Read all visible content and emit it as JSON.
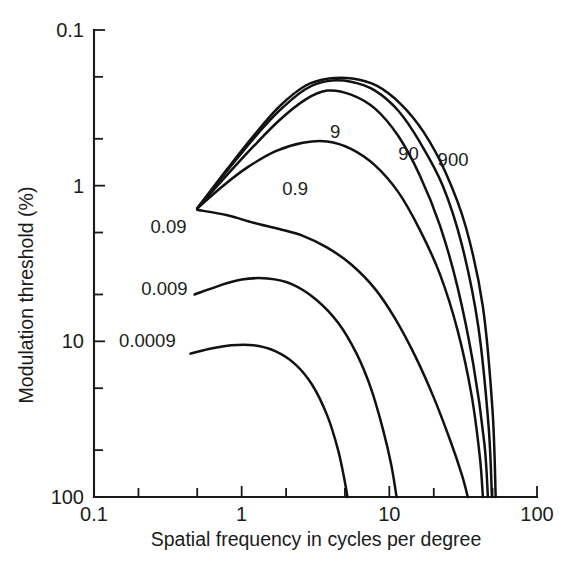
{
  "chart_data": {
    "type": "line",
    "title": "",
    "xlabel": "Spatial frequency in cycles per degree",
    "ylabel": "Modulation threshold (%)",
    "xscale": "log",
    "yscale": "log",
    "y_inverted": true,
    "xlim": [
      0.1,
      100
    ],
    "ylim": [
      0.1,
      100
    ],
    "grid": false,
    "legend": "inline curve labels",
    "x_tick_labels": [
      "0.1",
      "1",
      "10",
      "100"
    ],
    "x_major_ticks": [
      0.1,
      1,
      10,
      100
    ],
    "x_minor_ticks": [
      0.2,
      0.5,
      2,
      5,
      20,
      50
    ],
    "y_tick_labels": [
      "0.1",
      "1",
      "10",
      "100"
    ],
    "y_major_ticks": [
      0.1,
      1,
      10,
      100
    ],
    "y_minor_ticks": [
      0.2,
      0.5,
      2,
      5,
      20,
      50
    ],
    "series": [
      {
        "name": "0.0009",
        "label": "0.0009",
        "label_x": 0.23,
        "label_y": 10.0,
        "points": [
          [
            0.45,
            12.0
          ],
          [
            0.6,
            11.2
          ],
          [
            0.85,
            10.6
          ],
          [
            1.2,
            10.6
          ],
          [
            1.7,
            11.6
          ],
          [
            2.3,
            14.0
          ],
          [
            3.0,
            19.0
          ],
          [
            3.8,
            30.0
          ],
          [
            4.5,
            50.0
          ],
          [
            5.0,
            80.0
          ],
          [
            5.2,
            100.0
          ]
        ]
      },
      {
        "name": "0.009",
        "label": "0.009",
        "label_x": 0.3,
        "label_y": 4.6,
        "points": [
          [
            0.48,
            5.0
          ],
          [
            0.7,
            4.4
          ],
          [
            1.0,
            4.0
          ],
          [
            1.5,
            3.95
          ],
          [
            2.2,
            4.3
          ],
          [
            3.2,
            5.4
          ],
          [
            4.5,
            7.6
          ],
          [
            6.0,
            12.0
          ],
          [
            7.5,
            20.0
          ],
          [
            9.0,
            36.0
          ],
          [
            10.3,
            62.0
          ],
          [
            11.2,
            100.0
          ]
        ]
      },
      {
        "name": "0.09",
        "label": "0.09",
        "label_x": 0.32,
        "label_y": 1.85,
        "points": [
          [
            0.5,
            1.43
          ],
          [
            0.8,
            1.55
          ],
          [
            1.2,
            1.73
          ],
          [
            1.8,
            1.9
          ],
          [
            2.6,
            2.1
          ],
          [
            3.8,
            2.5
          ],
          [
            5.5,
            3.2
          ],
          [
            8.0,
            4.6
          ],
          [
            11.0,
            7.2
          ],
          [
            15.0,
            12.5
          ],
          [
            20.0,
            23.0
          ],
          [
            26.0,
            44.0
          ],
          [
            31.0,
            72.0
          ],
          [
            34.0,
            100.0
          ]
        ]
      },
      {
        "name": "0.9",
        "label": "0.9",
        "label_x": 2.3,
        "label_y": 1.05,
        "points": [
          [
            0.5,
            1.4
          ],
          [
            0.75,
            1.0
          ],
          [
            1.1,
            0.76
          ],
          [
            1.7,
            0.6
          ],
          [
            2.6,
            0.53
          ],
          [
            3.8,
            0.52
          ],
          [
            5.5,
            0.58
          ],
          [
            8.0,
            0.74
          ],
          [
            11.5,
            1.1
          ],
          [
            16.0,
            1.9
          ],
          [
            22.0,
            3.7
          ],
          [
            29.0,
            8.5
          ],
          [
            36.0,
            22.0
          ],
          [
            41.0,
            55.0
          ],
          [
            43.0,
            100.0
          ]
        ]
      },
      {
        "name": "9",
        "label": "9",
        "label_x": 4.3,
        "label_y": 0.45,
        "points": [
          [
            0.5,
            1.4
          ],
          [
            0.8,
            0.85
          ],
          [
            1.2,
            0.56
          ],
          [
            1.8,
            0.38
          ],
          [
            2.7,
            0.28
          ],
          [
            3.8,
            0.245
          ],
          [
            5.5,
            0.26
          ],
          [
            8.0,
            0.32
          ],
          [
            11.5,
            0.48
          ],
          [
            16.0,
            0.85
          ],
          [
            22.0,
            1.8
          ],
          [
            29.0,
            4.5
          ],
          [
            37.0,
            14.0
          ],
          [
            44.0,
            45.0
          ],
          [
            46.5,
            100.0
          ]
        ]
      },
      {
        "name": "90",
        "label": "90",
        "label_x": 13.5,
        "label_y": 0.63,
        "points": [
          [
            0.5,
            1.4
          ],
          [
            0.8,
            0.8
          ],
          [
            1.2,
            0.5
          ],
          [
            1.8,
            0.33
          ],
          [
            2.7,
            0.24
          ],
          [
            3.8,
            0.213
          ],
          [
            5.5,
            0.215
          ],
          [
            8.0,
            0.245
          ],
          [
            11.5,
            0.33
          ],
          [
            16.0,
            0.52
          ],
          [
            23.0,
            1.0
          ],
          [
            31.0,
            2.4
          ],
          [
            40.0,
            8.0
          ],
          [
            47.0,
            35.0
          ],
          [
            49.5,
            100.0
          ]
        ]
      },
      {
        "name": "900",
        "label": "900",
        "label_x": 27.0,
        "label_y": 0.68,
        "points": [
          [
            0.5,
            1.4
          ],
          [
            0.8,
            0.78
          ],
          [
            1.2,
            0.48
          ],
          [
            1.8,
            0.31
          ],
          [
            2.7,
            0.228
          ],
          [
            3.9,
            0.205
          ],
          [
            5.6,
            0.205
          ],
          [
            8.2,
            0.228
          ],
          [
            12.0,
            0.3
          ],
          [
            17.0,
            0.45
          ],
          [
            24.0,
            0.82
          ],
          [
            33.0,
            1.85
          ],
          [
            43.0,
            6.0
          ],
          [
            50.0,
            28.0
          ],
          [
            52.5,
            100.0
          ]
        ]
      }
    ]
  }
}
